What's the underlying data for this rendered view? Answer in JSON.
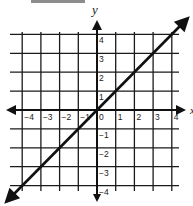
{
  "header_bar": {
    "color": "#8c8c8c"
  },
  "chart_data": {
    "type": "line",
    "title": "",
    "xlabel": "x",
    "ylabel": "y",
    "xlim": [
      -4.5,
      4.5
    ],
    "ylim": [
      -4.2,
      4.2
    ],
    "grid": true,
    "legend": null,
    "x_ticks": [
      -4,
      -3,
      -2,
      -1,
      0,
      1,
      2,
      3,
      4
    ],
    "y_ticks": [
      4,
      3,
      2,
      1,
      -1,
      -2,
      -3,
      -4
    ],
    "x_tick_labels": [
      "−4",
      "−3",
      "−2",
      "−1",
      "0",
      "1",
      "2",
      "3",
      "4"
    ],
    "y_tick_labels": [
      "4",
      "3",
      "2",
      "1",
      "−1",
      "−2",
      "−3",
      "−4"
    ],
    "series": [
      {
        "name": "y = x",
        "equation": "y = x",
        "x": [
          -4.8,
          -4,
          -3,
          -2,
          -1,
          0,
          1,
          2,
          3,
          4,
          4.8
        ],
        "y": [
          -4.8,
          -4,
          -3,
          -2,
          -1,
          0,
          1,
          2,
          3,
          4,
          4.8
        ],
        "arrows": "both",
        "color": "#111111"
      }
    ],
    "axes_arrows": "both",
    "colors": {
      "grid": "#1a1a1a",
      "axis": "#111111",
      "line": "#111111"
    }
  }
}
